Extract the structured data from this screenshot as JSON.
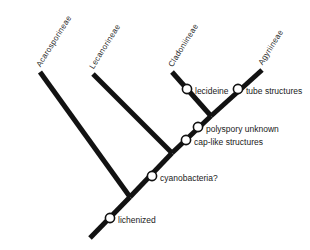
{
  "figure": {
    "type": "cladogram",
    "orientation": "diagonal-ladderized",
    "background_color": "#ffffff",
    "branch_color": "#121212",
    "node_fill_color": "#ffffff",
    "node_stroke_color": "#121212",
    "text_color": "#1a1a1a"
  },
  "taxa": [
    {
      "label": "Acarosporineae",
      "tip_x": 40,
      "tip_y": 72,
      "rotation": -58
    },
    {
      "label": "Lecanorineae",
      "tip_x": 93,
      "tip_y": 74,
      "rotation": -58
    },
    {
      "label": "Cladoniineae",
      "tip_x": 172,
      "tip_y": 72,
      "rotation": -58
    },
    {
      "label": "Agyriineae",
      "tip_x": 262,
      "tip_y": 70,
      "rotation": -58
    }
  ],
  "characters": [
    {
      "label": "lecideine",
      "x": 187,
      "y": 89,
      "text_x": 195,
      "text_y": 92
    },
    {
      "label": "tube structures",
      "x": 238,
      "y": 89,
      "text_x": 246,
      "text_y": 92
    },
    {
      "label": "polyspory  unknown",
      "x": 198,
      "y": 127,
      "text_x": 206,
      "text_y": 130
    },
    {
      "label": "cap-like  structures",
      "x": 186,
      "y": 140,
      "text_x": 194,
      "text_y": 143
    },
    {
      "label": "cyanobacteria?",
      "x": 152,
      "y": 176,
      "text_x": 160,
      "text_y": 179
    },
    {
      "label": "lichenized",
      "x": 110,
      "y": 218,
      "text_x": 118,
      "text_y": 221
    }
  ],
  "branches": [
    {
      "name": "root-stem",
      "x1": 90,
      "y1": 238,
      "x2": 130,
      "y2": 197
    },
    {
      "name": "acarosporineae-branch",
      "x1": 130,
      "y1": 197,
      "x2": 40,
      "y2": 72
    },
    {
      "name": "backbone-lower",
      "x1": 130,
      "y1": 197,
      "x2": 172,
      "y2": 153
    },
    {
      "name": "lecanorineae-branch",
      "x1": 172,
      "y1": 153,
      "x2": 93,
      "y2": 74
    },
    {
      "name": "backbone-upper",
      "x1": 172,
      "y1": 153,
      "x2": 211,
      "y2": 116
    },
    {
      "name": "cladoniineae-branch",
      "x1": 211,
      "y1": 116,
      "x2": 172,
      "y2": 72
    },
    {
      "name": "agyriineae-branch",
      "x1": 211,
      "y1": 116,
      "x2": 262,
      "y2": 70
    }
  ],
  "node_radius": 4.6
}
